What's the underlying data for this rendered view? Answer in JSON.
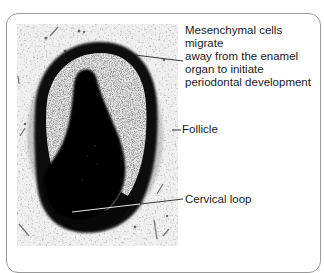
{
  "figure": {
    "type": "labeled histology micrograph",
    "frame_border_color": "#9a9a9a",
    "labels": [
      {
        "id": "mesenchymal",
        "text": "Mesenchymal cells migrate away from the enamel organ to initiate periodontal development",
        "lines": [
          "Mesenchymal cells migrate",
          "away from the enamel",
          "organ to initiate",
          "periodontal development"
        ]
      },
      {
        "id": "follicle",
        "text": "Follicle"
      },
      {
        "id": "cervical_loop",
        "text": "Cervical loop"
      }
    ]
  }
}
